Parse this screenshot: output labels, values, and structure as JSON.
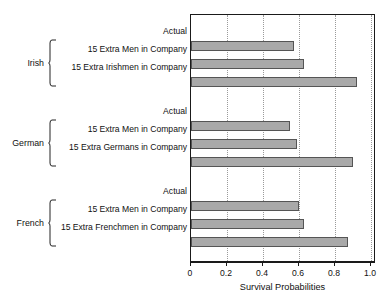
{
  "chart_data": {
    "type": "bar",
    "orientation": "horizontal",
    "title": "",
    "xlabel": "Survival Probabilities",
    "ylabel": "",
    "xlim": [
      0,
      1.0
    ],
    "xticks": [
      0,
      0.2,
      0.4,
      0.6,
      0.8,
      1.0
    ],
    "xtick_labels": [
      "0",
      "0.2",
      "0.4",
      "0.6",
      "0.8",
      "1.0"
    ],
    "grid": "vertical-dotted",
    "legend": "none",
    "bar_color": "#a9a9a9",
    "bar_edge_color": "#555555",
    "frame_color": "#1a1a1a",
    "groups": [
      {
        "name": "Irish",
        "categories": [
          "Actual",
          "15 Extra Men in Company",
          "15 Extra Irishmen in Company"
        ],
        "values": [
          0.57,
          0.63,
          0.92
        ]
      },
      {
        "name": "German",
        "categories": [
          "Actual",
          "15 Extra Men in Company",
          "15 Extra Germans in Company"
        ],
        "values": [
          0.55,
          0.59,
          0.9
        ]
      },
      {
        "name": "French",
        "categories": [
          "Actual",
          "15 Extra Men in Company",
          "15 Extra Frenchmen in Company"
        ],
        "values": [
          0.6,
          0.63,
          0.87
        ]
      }
    ]
  }
}
